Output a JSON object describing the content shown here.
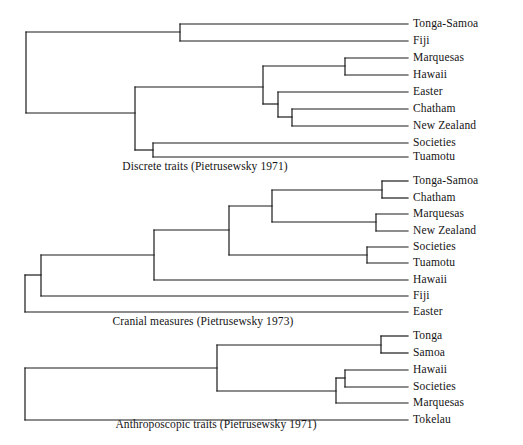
{
  "figure": {
    "background_color": "#ffffff",
    "line_color": "#1a1a1a",
    "text_color": "#141414",
    "width": 523,
    "height": 445
  },
  "chart_data": {
    "type": "dendrogram-set",
    "title": "",
    "panels": [
      {
        "id": "discrete-traits",
        "caption": "Discrete traits (Pietrusewsky 1971)",
        "caption_x": 205,
        "caption_y": 166,
        "leaves": [
          {
            "label": "Tonga-Samoa",
            "x": 408,
            "y": 24
          },
          {
            "label": "Fiji",
            "x": 408,
            "y": 41
          },
          {
            "label": "Marquesas",
            "x": 408,
            "y": 58
          },
          {
            "label": "Hawaii",
            "x": 408,
            "y": 75
          },
          {
            "label": "Easter",
            "x": 408,
            "y": 92
          },
          {
            "label": "Chatham",
            "x": 408,
            "y": 109
          },
          {
            "label": "New Zealand",
            "x": 408,
            "y": 126
          },
          {
            "label": "Societies",
            "x": 408,
            "y": 143
          },
          {
            "label": "Tuamotu",
            "x": 408,
            "y": 157
          }
        ],
        "segments": [
          [
            408,
            24,
            180,
            24
          ],
          [
            408,
            41,
            180,
            41
          ],
          [
            180,
            24,
            180,
            41
          ],
          [
            180,
            32,
            26,
            32
          ],
          [
            408,
            58,
            345,
            58
          ],
          [
            408,
            75,
            345,
            75
          ],
          [
            345,
            58,
            345,
            75
          ],
          [
            345,
            66,
            263,
            66
          ],
          [
            408,
            92,
            278,
            92
          ],
          [
            408,
            109,
            292,
            109
          ],
          [
            408,
            126,
            292,
            126
          ],
          [
            292,
            109,
            292,
            126
          ],
          [
            292,
            117,
            278,
            117
          ],
          [
            278,
            92,
            278,
            117
          ],
          [
            278,
            104,
            263,
            104
          ],
          [
            263,
            66,
            263,
            104
          ],
          [
            263,
            87,
            135,
            87
          ],
          [
            408,
            143,
            153,
            143
          ],
          [
            408,
            157,
            153,
            157
          ],
          [
            153,
            143,
            153,
            157
          ],
          [
            153,
            150,
            135,
            150
          ],
          [
            135,
            87,
            135,
            150
          ],
          [
            135,
            113,
            26,
            113
          ],
          [
            26,
            32,
            26,
            113
          ]
        ]
      },
      {
        "id": "cranial-measures",
        "caption": "Cranial measures (Pietrusewsky 1973)",
        "caption_x": 203,
        "caption_y": 321,
        "leaves": [
          {
            "label": "Tonga-Samoa",
            "x": 408,
            "y": 181
          },
          {
            "label": "Chatham",
            "x": 408,
            "y": 198
          },
          {
            "label": "Marquesas",
            "x": 408,
            "y": 214
          },
          {
            "label": "New Zealand",
            "x": 408,
            "y": 231
          },
          {
            "label": "Societies",
            "x": 408,
            "y": 247
          },
          {
            "label": "Tuamotu",
            "x": 408,
            "y": 263
          },
          {
            "label": "Hawaii",
            "x": 408,
            "y": 280
          },
          {
            "label": "Fiji",
            "x": 408,
            "y": 296
          },
          {
            "label": "Easter",
            "x": 408,
            "y": 312
          }
        ],
        "segments": [
          [
            408,
            181,
            382,
            181
          ],
          [
            408,
            198,
            382,
            198
          ],
          [
            382,
            181,
            382,
            198
          ],
          [
            382,
            190,
            272,
            190
          ],
          [
            408,
            214,
            376,
            214
          ],
          [
            408,
            231,
            376,
            231
          ],
          [
            376,
            214,
            376,
            231
          ],
          [
            376,
            222,
            272,
            222
          ],
          [
            272,
            190,
            272,
            222
          ],
          [
            272,
            206,
            229,
            206
          ],
          [
            408,
            247,
            367,
            247
          ],
          [
            408,
            263,
            367,
            263
          ],
          [
            367,
            247,
            367,
            263
          ],
          [
            367,
            255,
            229,
            255
          ],
          [
            229,
            206,
            229,
            255
          ],
          [
            229,
            230,
            154,
            230
          ],
          [
            408,
            280,
            154,
            280
          ],
          [
            154,
            230,
            154,
            280
          ],
          [
            154,
            255,
            41,
            255
          ],
          [
            408,
            296,
            41,
            296
          ],
          [
            41,
            255,
            41,
            296
          ],
          [
            41,
            275,
            25,
            275
          ],
          [
            408,
            312,
            25,
            312
          ],
          [
            25,
            275,
            25,
            312
          ]
        ]
      },
      {
        "id": "anthroposcopic-traits",
        "caption": "Anthroposcopic traits (Pietrusewsky 1971)",
        "caption_x": 216,
        "caption_y": 424,
        "leaves": [
          {
            "label": "Tonga",
            "x": 408,
            "y": 336
          },
          {
            "label": "Samoa",
            "x": 408,
            "y": 353
          },
          {
            "label": "Hawaii",
            "x": 408,
            "y": 370
          },
          {
            "label": "Societies",
            "x": 408,
            "y": 387
          },
          {
            "label": "Marquesas",
            "x": 408,
            "y": 403
          },
          {
            "label": "Tokelau",
            "x": 408,
            "y": 420
          }
        ],
        "segments": [
          [
            408,
            336,
            381,
            336
          ],
          [
            408,
            353,
            381,
            353
          ],
          [
            381,
            336,
            381,
            353
          ],
          [
            381,
            345,
            217,
            345
          ],
          [
            408,
            370,
            345,
            370
          ],
          [
            408,
            387,
            345,
            387
          ],
          [
            345,
            370,
            345,
            387
          ],
          [
            345,
            378,
            336,
            378
          ],
          [
            408,
            403,
            336,
            403
          ],
          [
            336,
            378,
            336,
            403
          ],
          [
            336,
            391,
            217,
            391
          ],
          [
            217,
            345,
            217,
            391
          ],
          [
            217,
            368,
            25,
            368
          ],
          [
            408,
            420,
            25,
            420
          ],
          [
            25,
            368,
            25,
            420
          ]
        ]
      }
    ]
  }
}
